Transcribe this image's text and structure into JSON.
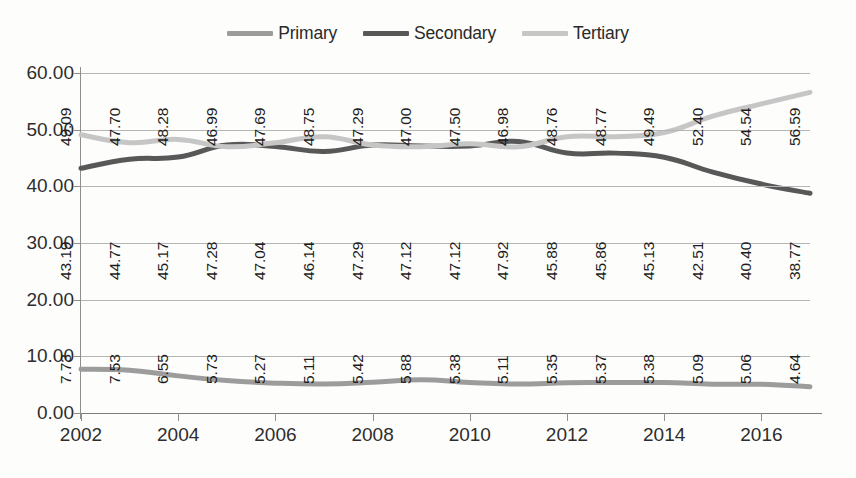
{
  "chart_data": {
    "type": "line",
    "title": "",
    "subtitle": "",
    "xlabel": "",
    "ylabel": "",
    "x": [
      2002,
      2003,
      2004,
      2005,
      2006,
      2007,
      2008,
      2009,
      2010,
      2011,
      2012,
      2013,
      2014,
      2015,
      2016,
      2017
    ],
    "categories": [
      "2002",
      "2003",
      "2004",
      "2005",
      "2006",
      "2007",
      "2008",
      "2009",
      "2010",
      "2011",
      "2012",
      "2013",
      "2014",
      "2015",
      "2016",
      "2017"
    ],
    "xtick_labels": [
      "2002",
      "2004",
      "2006",
      "2008",
      "2010",
      "2012",
      "2014",
      "2016"
    ],
    "ytick_labels": [
      "0.00",
      "10.00",
      "20.00",
      "30.00",
      "40.00",
      "50.00",
      "60.00"
    ],
    "ylim": [
      0,
      60
    ],
    "xlim": [
      2002,
      2017
    ],
    "grid": true,
    "legend_position": "top-center",
    "series": [
      {
        "name": "Primary",
        "color": "#9c9c9c",
        "values": [
          7.73,
          7.53,
          6.55,
          5.73,
          5.27,
          5.11,
          5.42,
          5.88,
          5.38,
          5.11,
          5.35,
          5.37,
          5.38,
          5.09,
          5.06,
          4.64
        ],
        "labels": [
          "7.73",
          "7.53",
          "6.55",
          "5.73",
          "5.27",
          "5.11",
          "5.42",
          "5.88",
          "5.38",
          "5.11",
          "5.35",
          "5.37",
          "5.38",
          "5.09",
          "5.06",
          "4.64"
        ]
      },
      {
        "name": "Secondary",
        "color": "#585858",
        "values": [
          43.19,
          44.77,
          45.17,
          47.28,
          47.04,
          46.14,
          47.29,
          47.12,
          47.12,
          47.92,
          45.88,
          45.86,
          45.13,
          42.51,
          40.4,
          38.77
        ],
        "labels": [
          "43.19",
          "44.77",
          "45.17",
          "47.28",
          "47.04",
          "46.14",
          "47.29",
          "47.12",
          "47.12",
          "47.92",
          "45.88",
          "45.86",
          "45.13",
          "42.51",
          "40.40",
          "38.77"
        ]
      },
      {
        "name": "Tertiary",
        "color": "#c6c6c6",
        "values": [
          49.09,
          47.7,
          48.28,
          46.99,
          47.69,
          48.75,
          47.29,
          47.0,
          47.5,
          46.98,
          48.76,
          48.77,
          49.49,
          52.4,
          54.54,
          56.59
        ],
        "labels": [
          "49.09",
          "47.70",
          "48.28",
          "46.99",
          "47.69",
          "48.75",
          "47.29",
          "47.00",
          "47.50",
          "46.98",
          "48.76",
          "48.77",
          "49.49",
          "52.40",
          "54.54",
          "56.59"
        ]
      }
    ]
  },
  "legend": {
    "items": [
      {
        "label": "Primary",
        "color": "#9c9c9c"
      },
      {
        "label": "Secondary",
        "color": "#585858"
      },
      {
        "label": "Tertiary",
        "color": "#c6c6c6"
      }
    ]
  },
  "colors": {
    "primary": "#9c9c9c",
    "secondary": "#585858",
    "tertiary": "#c6c6c6",
    "gridline": "#b5b5b5",
    "axis": "#8e8e8e",
    "text": "#2d2d2d",
    "background": "#fdfdfc"
  }
}
